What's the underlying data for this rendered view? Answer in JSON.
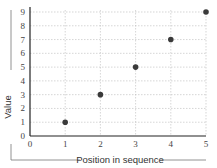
{
  "chart_data": {
    "type": "scatter",
    "title": "",
    "xlabel": "Position in sequence",
    "ylabel": "Value",
    "x": [
      1,
      2,
      3,
      4,
      5
    ],
    "y": [
      1,
      3,
      5,
      7,
      9
    ],
    "xlim": [
      0,
      5
    ],
    "ylim": [
      0,
      9
    ],
    "xticks": [
      "0",
      "1",
      "2",
      "3",
      "4",
      "5"
    ],
    "yticks": [
      "0",
      "1",
      "2",
      "3",
      "4",
      "5",
      "6",
      "7",
      "8",
      "9"
    ],
    "grid": true,
    "legend": null,
    "point_color": "#3a3a3a"
  }
}
